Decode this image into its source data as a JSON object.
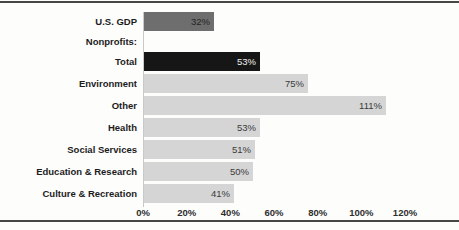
{
  "chart_data": {
    "type": "bar",
    "orientation": "horizontal",
    "title": "",
    "xlabel": "",
    "ylabel": "",
    "xlim": [
      0,
      120
    ],
    "x_ticks": [
      "0%",
      "20%",
      "40%",
      "60%",
      "80%",
      "100%",
      "120%"
    ],
    "x_tick_values": [
      0,
      20,
      40,
      60,
      80,
      100,
      120
    ],
    "grid": false,
    "legend": false,
    "rows": [
      {
        "label": "U.S. GDP",
        "value": 32,
        "value_label": "32%",
        "bar_style": "medium-gray"
      },
      {
        "label": "Nonprofits:",
        "value": null,
        "value_label": "",
        "bar_style": "none"
      },
      {
        "label": "Total",
        "value": 53,
        "value_label": "53%",
        "bar_style": "black"
      },
      {
        "label": "Environment",
        "value": 75,
        "value_label": "75%",
        "bar_style": "light-gray"
      },
      {
        "label": "Other",
        "value": 111,
        "value_label": "111%",
        "bar_style": "light-gray"
      },
      {
        "label": "Health",
        "value": 53,
        "value_label": "53%",
        "bar_style": "light-gray"
      },
      {
        "label": "Social Services",
        "value": 51,
        "value_label": "51%",
        "bar_style": "light-gray"
      },
      {
        "label": "Education & Research",
        "value": 50,
        "value_label": "50%",
        "bar_style": "light-gray"
      },
      {
        "label": "Culture & Recreation",
        "value": 41,
        "value_label": "41%",
        "bar_style": "light-gray"
      }
    ],
    "colors": {
      "medium-gray": "#6e6e6e",
      "black": "#161616",
      "light-gray": "#d5d5d5",
      "value_text_on_light": "#3a3a3a",
      "value_text_on_medium": "#242424",
      "value_text_on_black": "#f0f0f0",
      "category_label": "#1c1c1c",
      "axis_label": "#2e2e2e",
      "axis_line": "#c9c9c9",
      "horizontal_rule": "#474747"
    }
  }
}
